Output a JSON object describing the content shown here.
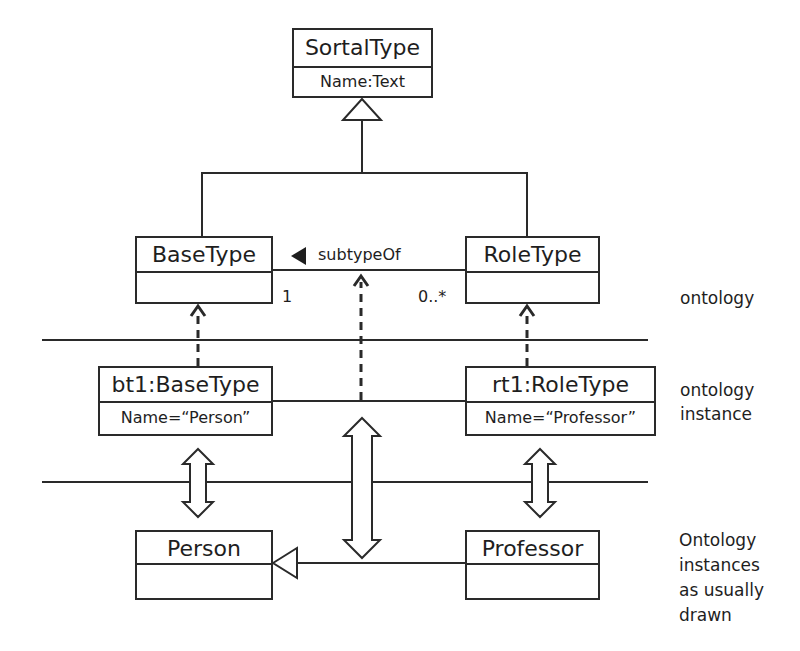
{
  "diagram": {
    "classes": {
      "sortal_type": {
        "name": "SortalType",
        "attribute": "Name:Text"
      },
      "base_type": {
        "name": "BaseType",
        "attribute": ""
      },
      "role_type": {
        "name": "RoleType",
        "attribute": ""
      },
      "bt1": {
        "name": "bt1:BaseType",
        "attribute": "Name=“Person”"
      },
      "rt1": {
        "name": "rt1:RoleType",
        "attribute": "Name=“Professor”"
      },
      "person": {
        "name": "Person",
        "attribute": ""
      },
      "professor": {
        "name": "Professor",
        "attribute": ""
      }
    },
    "association": {
      "name": "subtypeOf",
      "base_multiplicity": "1",
      "role_multiplicity": "0..*"
    },
    "layer_labels": {
      "ontology": [
        "ontology"
      ],
      "ontology_instance": [
        "ontology",
        "instance"
      ],
      "usual": [
        "Ontology",
        "instances",
        "as usually",
        "drawn"
      ]
    },
    "colors": {
      "line": "#2a2a2a",
      "background": "#ffffff",
      "text": "#1e1e1e"
    }
  }
}
